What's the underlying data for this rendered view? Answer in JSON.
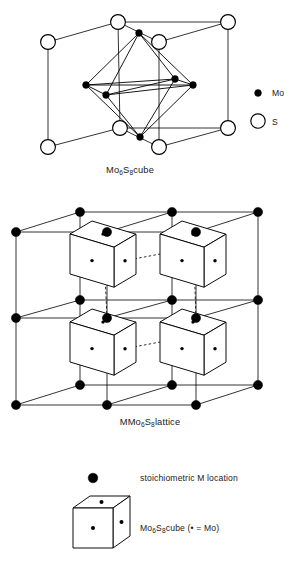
{
  "figure": {
    "width": 301,
    "height": 561,
    "background": "#ffffff",
    "ink": "#000000"
  },
  "panels": {
    "top": {
      "name": "Mo6S8 cube",
      "caption_parts": {
        "m": "Mo",
        "sub6": "6",
        "s": "S",
        "sub8": "8",
        "word": "cube"
      },
      "caption_plain": "Mo6S8 cube",
      "legend": [
        {
          "symbol": "filled-circle",
          "label": "Mo"
        },
        {
          "symbol": "open-circle",
          "label": "S"
        }
      ]
    },
    "middle": {
      "name": "MMo6S8 lattice",
      "caption_parts": {
        "m1": "MMo",
        "sub6": "6",
        "s": "S",
        "sub8": "8",
        "word": "lattice"
      },
      "caption_plain": "MMo6S8 lattice"
    },
    "bottom_legend": {
      "items": [
        {
          "symbol": "filled-circle",
          "label": "stoichiometric M location"
        },
        {
          "symbol": "cube-glyph",
          "label_parts": {
            "m": "Mo",
            "sub6": "6",
            "s": "S",
            "sub8": "8",
            "tail": "cube (• = Mo)"
          },
          "label_plain": "Mo6S8 cube (• = Mo)"
        }
      ]
    }
  },
  "chart_data": {
    "type": "diagram",
    "atom_species": [
      {
        "name": "Mo",
        "render": "filled-circle",
        "color": "#000000",
        "radius_px": 3.4
      },
      {
        "name": "S",
        "render": "open-circle",
        "color": "#ffffff",
        "stroke": "#000000",
        "radius_px": 7.4
      },
      {
        "name": "M",
        "render": "filled-circle",
        "color": "#000000",
        "radius_px": 4.6
      }
    ],
    "top_panel": {
      "sulfur_cube_vertices": [
        {
          "id": "back-top-left",
          "x": 48,
          "y": 42
        },
        {
          "id": "back-top-mid",
          "x": 118,
          "y": 22
        },
        {
          "id": "back-top-right",
          "x": 228,
          "y": 22
        },
        {
          "id": "front-top-right",
          "x": 159,
          "y": 42
        },
        {
          "id": "back-bottom-left",
          "x": 48,
          "y": 147
        },
        {
          "id": "back-bottom-mid",
          "x": 120,
          "y": 128
        },
        {
          "id": "back-bottom-right",
          "x": 228,
          "y": 128
        },
        {
          "id": "front-bottom-right",
          "x": 159,
          "y": 147
        }
      ],
      "molybdenum_octahedron_vertices": [
        {
          "id": "apex-top",
          "x": 139,
          "y": 33
        },
        {
          "id": "apex-bottom",
          "x": 140,
          "y": 137
        },
        {
          "id": "eq-left",
          "x": 86,
          "y": 85
        },
        {
          "id": "eq-front",
          "x": 106,
          "y": 95
        },
        {
          "id": "eq-back",
          "x": 175,
          "y": 79
        },
        {
          "id": "eq-right",
          "x": 193,
          "y": 85
        }
      ],
      "legend_positions": [
        {
          "label": "Mo",
          "cx": 258,
          "cy": 93,
          "text_x": 272,
          "text_y": 96
        },
        {
          "label": "S",
          "cx": 258,
          "cy": 121,
          "text_x": 272,
          "text_y": 125
        }
      ],
      "caption_pos": {
        "x": 130,
        "y": 173
      }
    },
    "middle_panel": {
      "lattice_rows": [
        {
          "id": "top-back",
          "y": 212,
          "xs": [
            80,
            172,
            258
          ]
        },
        {
          "id": "top-front",
          "y": 232,
          "xs": [
            16,
            107,
            196
          ]
        },
        {
          "id": "mid-back",
          "y": 300,
          "xs": [
            80,
            172,
            258
          ]
        },
        {
          "id": "mid-front",
          "y": 318,
          "xs": [
            16,
            107,
            196
          ]
        },
        {
          "id": "bottom-back",
          "y": 385,
          "xs": [
            80,
            172,
            258
          ]
        },
        {
          "id": "bottom-front",
          "y": 405,
          "xs": [
            16,
            107,
            196
          ]
        }
      ],
      "tilted_cubes": [
        {
          "id": "upper-left",
          "cx": 92,
          "cy": 265,
          "scale": 1.0
        },
        {
          "id": "upper-right",
          "cx": 182,
          "cy": 265,
          "scale": 1.0
        },
        {
          "id": "lower-left",
          "cx": 92,
          "cy": 353,
          "scale": 1.0
        },
        {
          "id": "lower-right",
          "cx": 182,
          "cy": 353,
          "scale": 1.0
        }
      ],
      "caption_pos": {
        "x": 150,
        "y": 425
      }
    },
    "bottom_legend_panel": {
      "marker": {
        "cx": 93,
        "cy": 478,
        "r": 4.8
      },
      "marker_text_pos": {
        "x": 140,
        "y": 481
      },
      "cube": {
        "cx": 93,
        "cy": 528
      },
      "cube_text_pos": {
        "x": 140,
        "y": 531
      }
    }
  }
}
